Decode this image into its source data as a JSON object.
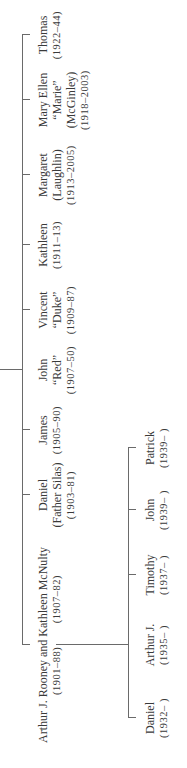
{
  "diagram": {
    "type": "family-tree",
    "orientation": "rotated-90-ccw",
    "parents": {
      "label": "Arthur J. Rooney and Kathleen McNulty",
      "father_dates": "(1901–88)",
      "mother_dates": "(1907–82)"
    },
    "siblings": [
      {
        "name": "Daniel",
        "line2": "(Father Silas)",
        "dates": "(1903–81)"
      },
      {
        "name": "James",
        "line2": "",
        "dates": "(1905–90)"
      },
      {
        "name": "John",
        "line2": "“Red”",
        "dates": "(1907–50)"
      },
      {
        "name": "Vincent",
        "line2": "“Duke”",
        "dates": "(1909–87)"
      },
      {
        "name": "Kathleen",
        "line2": "",
        "dates": "(1911–13)"
      },
      {
        "name": "Margaret",
        "line2": "(Laughlin)",
        "dates": "(1913–2005)"
      },
      {
        "name": "Mary Ellen",
        "line2": "“Marie”",
        "line3": "(McGinley)",
        "dates": "(1918–2003)"
      },
      {
        "name": "Thomas",
        "line2": "",
        "dates": "(1922–44)"
      }
    ],
    "children": [
      {
        "name": "Daniel",
        "dates": "(1932– )"
      },
      {
        "name": "Arthur J.",
        "dates": "(1935– )"
      },
      {
        "name": "Timothy",
        "dates": "(1937– )"
      },
      {
        "name": "John",
        "dates": "(1939– )"
      },
      {
        "name": "Patrick",
        "dates": "(1939– )"
      }
    ],
    "line_color": "#6a6a6a",
    "text_color": "#3a3a3a"
  }
}
